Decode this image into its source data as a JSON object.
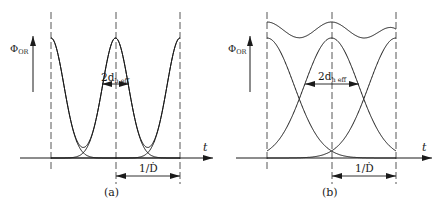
{
  "figure": {
    "panels": [
      {
        "id": "a",
        "caption": "(a)",
        "y_label": "Φ",
        "y_label_sub": "OR",
        "x_label": "t",
        "width_label_main": "2d",
        "width_label_sub": "h eff",
        "period_label": "1/Ḋ"
      },
      {
        "id": "b",
        "caption": "(b)",
        "y_label": "Φ",
        "y_label_sub": "OR",
        "x_label": "t",
        "width_label_main": "2d",
        "width_label_sub": "h eff",
        "period_label": "1/Ḋ"
      }
    ]
  },
  "chart_data": [
    {
      "type": "line",
      "title": "(a)",
      "xlabel": "t",
      "ylabel": "Φ_OR",
      "description": "Well-separated Gaussian pulses with period 1/Ḋ; sum shows deep dips between peaks",
      "annotations": [
        "2d_h eff",
        "1/Ḋ"
      ],
      "series": [
        {
          "name": "pulse",
          "shape": "gaussian",
          "centers_period_units": [
            -1,
            0,
            1
          ],
          "sigma_period_units": 0.2
        },
        {
          "name": "sum",
          "shape": "sum of gaussians"
        }
      ],
      "grid": false
    },
    {
      "type": "line",
      "title": "(b)",
      "xlabel": "t",
      "ylabel": "Φ_OR",
      "description": "Overlapping Gaussian pulses with period 1/Ḋ; sum shows shallow ripple",
      "annotations": [
        "2d_h eff",
        "1/Ḋ"
      ],
      "series": [
        {
          "name": "pulse",
          "shape": "gaussian",
          "centers_period_units": [
            -1,
            0,
            1
          ],
          "sigma_period_units": 0.42
        },
        {
          "name": "sum",
          "shape": "sum of gaussians"
        }
      ],
      "grid": false
    }
  ]
}
